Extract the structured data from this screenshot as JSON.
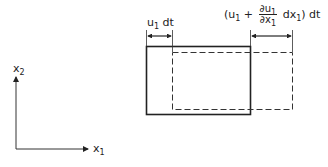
{
  "diagram": {
    "type": "fluid element deformation",
    "axes": {
      "vertical_label": "x",
      "vertical_sub": "2",
      "horizontal_label": "x",
      "horizontal_sub": "1"
    },
    "left_dimension": {
      "u": "u",
      "u_sub": "1",
      "rest": " dt"
    },
    "right_dimension": {
      "open": "(u",
      "open_sub": "1",
      "plus": " + ",
      "num": "∂u",
      "num_sub": "1",
      "den": "∂x",
      "den_sub": "1",
      "dx": " dx",
      "dx_sub": "1",
      "close": ") dt"
    },
    "shapes": {
      "original_element": "solid rectangle",
      "displaced_element": "dashed rectangle"
    },
    "colors": {
      "line": "#222222",
      "background": "#ffffff"
    }
  }
}
